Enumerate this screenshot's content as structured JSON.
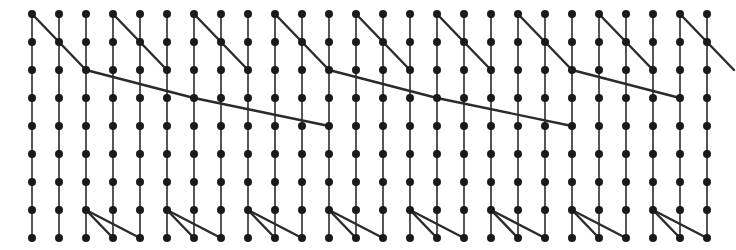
{
  "figure": {
    "name": "lattice-graph-diagram",
    "type": "node-link-lattice",
    "width": 736,
    "height": 250,
    "background_color": "#ffffff",
    "node_color": "#1a1a1a",
    "edge_color": "#2b2b2b",
    "node_radius": 4.0,
    "vertical_edge_width": 1.6,
    "diagonal_edge_width": 2.4,
    "grid": {
      "columns": 26,
      "rows": 9,
      "x_origin": 32,
      "y_origin": 14,
      "x_step": 27,
      "y_step": 28,
      "pattern_period_columns": 9
    },
    "vertical_chains": {
      "description": "every column carries a vertical chain of 9 nodes joined by 8 vertical edges",
      "count": 26
    },
    "diagonal_motifs": [
      {
        "name": "upper-staircase",
        "period_start_columns": [
          0,
          9,
          18
        ],
        "segments": [
          [
            0,
            0,
            1,
            1
          ],
          [
            1,
            1,
            2,
            2
          ]
        ]
      },
      {
        "name": "upper-short-zigzag-a",
        "period_start_columns": [
          3,
          12,
          21
        ],
        "segments": [
          [
            0,
            0,
            1,
            1
          ],
          [
            1,
            1,
            2,
            2
          ]
        ]
      },
      {
        "name": "upper-short-zigzag-b",
        "period_start_columns": [
          6,
          15,
          24
        ],
        "segments": [
          [
            0,
            0,
            1,
            1
          ],
          [
            1,
            1,
            2,
            2
          ]
        ]
      },
      {
        "name": "long-shallow-sweep",
        "period_start_columns": [
          2,
          11,
          20
        ],
        "segments": [
          [
            0,
            2,
            4,
            3
          ],
          [
            4,
            3,
            9,
            4
          ]
        ]
      },
      {
        "name": "lower-fan",
        "period_start_columns": [
          2,
          5,
          8,
          11,
          14,
          17,
          20,
          23
        ],
        "segments": [
          [
            0,
            7,
            1,
            8
          ],
          [
            0,
            7,
            2,
            8
          ]
        ]
      }
    ],
    "labels": {
      "title": "",
      "axis_x": "",
      "axis_y": ""
    }
  },
  "chart_data": {
    "type": "scatter",
    "title": "",
    "xlabel": "",
    "ylabel": "",
    "grid": false,
    "legend": null,
    "xlim": [
      0,
      25
    ],
    "ylim": [
      0,
      8
    ],
    "categories": [
      "c0",
      "c1",
      "c2",
      "c3",
      "c4",
      "c5",
      "c6",
      "c7",
      "c8",
      "c9",
      "c10",
      "c11",
      "c12",
      "c13",
      "c14",
      "c15",
      "c16",
      "c17",
      "c18",
      "c19",
      "c20",
      "c21",
      "c22",
      "c23",
      "c24",
      "c25"
    ],
    "series": [
      {
        "name": "row-0",
        "values": [
          0,
          0,
          0,
          0,
          0,
          0,
          0,
          0,
          0,
          0,
          0,
          0,
          0,
          0,
          0,
          0,
          0,
          0,
          0,
          0,
          0,
          0,
          0,
          0,
          0,
          0
        ]
      },
      {
        "name": "row-1",
        "values": [
          1,
          1,
          1,
          1,
          1,
          1,
          1,
          1,
          1,
          1,
          1,
          1,
          1,
          1,
          1,
          1,
          1,
          1,
          1,
          1,
          1,
          1,
          1,
          1,
          1,
          1
        ]
      },
      {
        "name": "row-2",
        "values": [
          2,
          2,
          2,
          2,
          2,
          2,
          2,
          2,
          2,
          2,
          2,
          2,
          2,
          2,
          2,
          2,
          2,
          2,
          2,
          2,
          2,
          2,
          2,
          2,
          2,
          2
        ]
      },
      {
        "name": "row-3",
        "values": [
          3,
          3,
          3,
          3,
          3,
          3,
          3,
          3,
          3,
          3,
          3,
          3,
          3,
          3,
          3,
          3,
          3,
          3,
          3,
          3,
          3,
          3,
          3,
          3,
          3,
          3
        ]
      },
      {
        "name": "row-4",
        "values": [
          4,
          4,
          4,
          4,
          4,
          4,
          4,
          4,
          4,
          4,
          4,
          4,
          4,
          4,
          4,
          4,
          4,
          4,
          4,
          4,
          4,
          4,
          4,
          4,
          4,
          4
        ]
      },
      {
        "name": "row-5",
        "values": [
          5,
          5,
          5,
          5,
          5,
          5,
          5,
          5,
          5,
          5,
          5,
          5,
          5,
          5,
          5,
          5,
          5,
          5,
          5,
          5,
          5,
          5,
          5,
          5,
          5,
          5
        ]
      },
      {
        "name": "row-6",
        "values": [
          6,
          6,
          6,
          6,
          6,
          6,
          6,
          6,
          6,
          6,
          6,
          6,
          6,
          6,
          6,
          6,
          6,
          6,
          6,
          6,
          6,
          6,
          6,
          6,
          6,
          6
        ]
      },
      {
        "name": "row-7",
        "values": [
          7,
          7,
          7,
          7,
          7,
          7,
          7,
          7,
          7,
          7,
          7,
          7,
          7,
          7,
          7,
          7,
          7,
          7,
          7,
          7,
          7,
          7,
          7,
          7,
          7,
          7
        ]
      },
      {
        "name": "row-8",
        "values": [
          8,
          8,
          8,
          8,
          8,
          8,
          8,
          8,
          8,
          8,
          8,
          8,
          8,
          8,
          8,
          8,
          8,
          8,
          8,
          8,
          8,
          8,
          8,
          8,
          8,
          8
        ]
      }
    ]
  }
}
